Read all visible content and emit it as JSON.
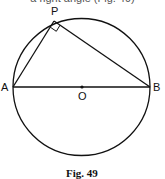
{
  "cropped_text": "a right angle (Fig. 49)",
  "figure": {
    "caption": "Fig. 49",
    "points": {
      "P": "P",
      "A": "A",
      "B": "B",
      "O": "O"
    }
  }
}
